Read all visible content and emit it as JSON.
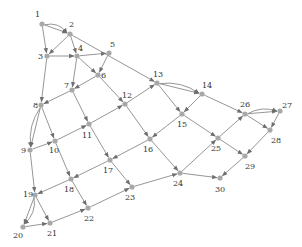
{
  "diagram": {
    "type": "directed-graph",
    "colors": {
      "edge": "#8a8a8a",
      "node": "#a8a8a8",
      "label": "#333333",
      "background": "#ffffff"
    },
    "nodes": [
      {
        "id": "1",
        "x": 42,
        "y": 24,
        "lx": 35,
        "ly": 17
      },
      {
        "id": "2",
        "x": 70,
        "y": 34,
        "lx": 69,
        "ly": 27
      },
      {
        "id": "3",
        "x": 47,
        "y": 56,
        "lx": 38,
        "ly": 59
      },
      {
        "id": "4",
        "x": 77,
        "y": 56,
        "lx": 78,
        "ly": 51
      },
      {
        "id": "5",
        "x": 109,
        "y": 53,
        "lx": 110,
        "ly": 47
      },
      {
        "id": "6",
        "x": 98,
        "y": 75,
        "lx": 101,
        "ly": 78
      },
      {
        "id": "7",
        "x": 72,
        "y": 90,
        "lx": 64,
        "ly": 88
      },
      {
        "id": "8",
        "x": 41,
        "y": 105,
        "lx": 33,
        "ly": 108
      },
      {
        "id": "9",
        "x": 30,
        "y": 150,
        "lx": 21,
        "ly": 153
      },
      {
        "id": "10",
        "x": 55,
        "y": 141,
        "lx": 49,
        "ly": 153
      },
      {
        "id": "11",
        "x": 89,
        "y": 124,
        "lx": 82,
        "ly": 138
      },
      {
        "id": "12",
        "x": 125,
        "y": 104,
        "lx": 122,
        "ly": 98
      },
      {
        "id": "13",
        "x": 157,
        "y": 83,
        "lx": 153,
        "ly": 77
      },
      {
        "id": "14",
        "x": 202,
        "y": 94,
        "lx": 202,
        "ly": 88
      },
      {
        "id": "15",
        "x": 182,
        "y": 114,
        "lx": 177,
        "ly": 127
      },
      {
        "id": "16",
        "x": 150,
        "y": 139,
        "lx": 143,
        "ly": 152
      },
      {
        "id": "17",
        "x": 110,
        "y": 160,
        "lx": 103,
        "ly": 173
      },
      {
        "id": "18",
        "x": 71,
        "y": 179,
        "lx": 64,
        "ly": 192
      },
      {
        "id": "19",
        "x": 35,
        "y": 195,
        "lx": 23,
        "ly": 197
      },
      {
        "id": "20",
        "x": 23,
        "y": 227,
        "lx": 13,
        "ly": 238
      },
      {
        "id": "21",
        "x": 50,
        "y": 223,
        "lx": 47,
        "ly": 236
      },
      {
        "id": "22",
        "x": 88,
        "y": 208,
        "lx": 84,
        "ly": 221
      },
      {
        "id": "23",
        "x": 132,
        "y": 187,
        "lx": 125,
        "ly": 200
      },
      {
        "id": "24",
        "x": 180,
        "y": 173,
        "lx": 173,
        "ly": 186
      },
      {
        "id": "25",
        "x": 218,
        "y": 138,
        "lx": 211,
        "ly": 151
      },
      {
        "id": "26",
        "x": 245,
        "y": 114,
        "lx": 240,
        "ly": 107
      },
      {
        "id": "27",
        "x": 280,
        "y": 111,
        "lx": 282,
        "ly": 108
      },
      {
        "id": "28",
        "x": 270,
        "y": 130,
        "lx": 271,
        "ly": 143
      },
      {
        "id": "29",
        "x": 245,
        "y": 156,
        "lx": 245,
        "ly": 169
      },
      {
        "id": "30",
        "x": 220,
        "y": 178,
        "lx": 215,
        "ly": 192
      }
    ],
    "edges": [
      {
        "from": "1",
        "to": "2",
        "curve": 0
      },
      {
        "from": "1",
        "to": "2",
        "curve": -8
      },
      {
        "from": "1",
        "to": "3",
        "curve": 0
      },
      {
        "from": "2",
        "to": "3",
        "curve": 0
      },
      {
        "from": "2",
        "to": "4",
        "curve": 0
      },
      {
        "from": "2",
        "to": "13",
        "curve": 0
      },
      {
        "from": "3",
        "to": "4",
        "curve": 0
      },
      {
        "from": "3",
        "to": "8",
        "curve": 0
      },
      {
        "from": "4",
        "to": "5",
        "curve": 0
      },
      {
        "from": "4",
        "to": "6",
        "curve": 0
      },
      {
        "from": "4",
        "to": "7",
        "curve": 0
      },
      {
        "from": "5",
        "to": "6",
        "curve": 0
      },
      {
        "from": "6",
        "to": "7",
        "curve": 0
      },
      {
        "from": "6",
        "to": "12",
        "curve": 0
      },
      {
        "from": "7",
        "to": "8",
        "curve": 0
      },
      {
        "from": "7",
        "to": "11",
        "curve": 0
      },
      {
        "from": "8",
        "to": "9",
        "curve": 0
      },
      {
        "from": "8",
        "to": "9",
        "curve": 8
      },
      {
        "from": "8",
        "to": "10",
        "curve": 0
      },
      {
        "from": "9",
        "to": "10",
        "curve": 0
      },
      {
        "from": "9",
        "to": "19",
        "curve": 0
      },
      {
        "from": "10",
        "to": "11",
        "curve": 0
      },
      {
        "from": "10",
        "to": "18",
        "curve": 0
      },
      {
        "from": "11",
        "to": "12",
        "curve": 0
      },
      {
        "from": "11",
        "to": "17",
        "curve": 0
      },
      {
        "from": "12",
        "to": "13",
        "curve": 0
      },
      {
        "from": "12",
        "to": "16",
        "curve": 0
      },
      {
        "from": "13",
        "to": "14",
        "curve": 0
      },
      {
        "from": "13",
        "to": "14",
        "curve": -8
      },
      {
        "from": "13",
        "to": "15",
        "curve": 0
      },
      {
        "from": "14",
        "to": "15",
        "curve": 0
      },
      {
        "from": "14",
        "to": "26",
        "curve": 0
      },
      {
        "from": "15",
        "to": "16",
        "curve": 0
      },
      {
        "from": "15",
        "to": "25",
        "curve": 0
      },
      {
        "from": "16",
        "to": "17",
        "curve": 0
      },
      {
        "from": "16",
        "to": "24",
        "curve": 0
      },
      {
        "from": "17",
        "to": "18",
        "curve": 0
      },
      {
        "from": "17",
        "to": "23",
        "curve": 0
      },
      {
        "from": "18",
        "to": "19",
        "curve": 0
      },
      {
        "from": "18",
        "to": "22",
        "curve": 0
      },
      {
        "from": "19",
        "to": "20",
        "curve": 0
      },
      {
        "from": "19",
        "to": "20",
        "curve": -8
      },
      {
        "from": "19",
        "to": "21",
        "curve": 0
      },
      {
        "from": "20",
        "to": "21",
        "curve": 0
      },
      {
        "from": "21",
        "to": "22",
        "curve": 0
      },
      {
        "from": "22",
        "to": "23",
        "curve": 0
      },
      {
        "from": "23",
        "to": "24",
        "curve": 0
      },
      {
        "from": "24",
        "to": "25",
        "curve": 0
      },
      {
        "from": "24",
        "to": "30",
        "curve": 0
      },
      {
        "from": "25",
        "to": "26",
        "curve": 0
      },
      {
        "from": "25",
        "to": "29",
        "curve": 0
      },
      {
        "from": "26",
        "to": "27",
        "curve": 0
      },
      {
        "from": "26",
        "to": "27",
        "curve": -7
      },
      {
        "from": "26",
        "to": "28",
        "curve": 0
      },
      {
        "from": "27",
        "to": "28",
        "curve": 0
      },
      {
        "from": "28",
        "to": "29",
        "curve": 0
      },
      {
        "from": "29",
        "to": "30",
        "curve": 0
      }
    ]
  }
}
